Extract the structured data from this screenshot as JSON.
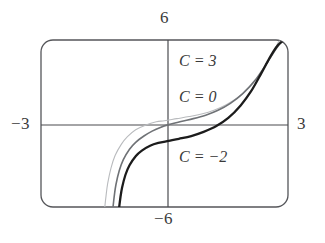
{
  "figure": {
    "kind": "graphing-calculator-plot",
    "background_color": "#ffffff",
    "frame": {
      "left": 41,
      "top": 40,
      "right": 288,
      "bottom": 207,
      "corner_radius": 12,
      "stroke_color": "#55565a",
      "stroke_width": 1.3
    },
    "axes": {
      "x_axis_y_px": 125,
      "y_axis_x_px": 168,
      "stroke_color": "#4a4b4f",
      "stroke_width": 1.2
    },
    "tick_labels": {
      "top": "6",
      "bottom": "−6",
      "left": "−3",
      "right": "3"
    }
  },
  "chart_data": {
    "type": "line",
    "title": "",
    "xlabel": "",
    "ylabel": "",
    "xlim": [
      -3,
      3
    ],
    "ylim": [
      -6,
      6
    ],
    "grid": false,
    "legend": "inline-curve-labels",
    "annotations": [
      {
        "text": "C = 3",
        "x_px": 179,
        "y_px": 52,
        "series": "C = 3"
      },
      {
        "text": "C = 0",
        "x_px": 179,
        "y_px": 88,
        "series": "C = 0"
      },
      {
        "text": "C = −2",
        "x_px": 179,
        "y_px": 148,
        "series": "C = −2"
      }
    ],
    "series": [
      {
        "name": "C = 3",
        "label": "C = 3",
        "C": 3,
        "color": "#b9bbbe",
        "stroke_width": 1.1,
        "x": [
          -1.45,
          -1.42,
          -1.38,
          -1.3,
          -1.2,
          -1.05,
          -0.9,
          -0.7,
          -0.45,
          -0.2,
          0.0,
          0.3,
          0.6,
          0.9,
          1.2,
          1.5,
          1.8,
          2.1,
          2.4,
          2.62,
          2.74,
          2.8
        ],
        "y": [
          -6.0,
          -5.2,
          -4.3,
          -3.2,
          -2.3,
          -1.5,
          -0.95,
          -0.45,
          -0.1,
          0.12,
          0.2,
          0.35,
          0.5,
          0.68,
          0.95,
          1.35,
          1.9,
          2.7,
          3.9,
          5.0,
          5.7,
          6.0
        ]
      },
      {
        "name": "C = 0",
        "label": "C = 0",
        "C": 0,
        "color": "#6f7276",
        "stroke_width": 1.6,
        "x": [
          -1.25,
          -1.22,
          -1.18,
          -1.1,
          -1.0,
          -0.85,
          -0.7,
          -0.5,
          -0.3,
          -0.1,
          0.1,
          0.4,
          0.7,
          1.0,
          1.3,
          1.6,
          1.9,
          2.2,
          2.5,
          2.72,
          2.84,
          2.9
        ],
        "y": [
          -6.0,
          -5.2,
          -4.4,
          -3.4,
          -2.6,
          -1.85,
          -1.35,
          -0.9,
          -0.55,
          -0.28,
          -0.08,
          0.15,
          0.35,
          0.6,
          0.95,
          1.45,
          2.15,
          3.1,
          4.4,
          5.4,
          5.85,
          6.0
        ]
      },
      {
        "name": "C = −2",
        "label": "C = −2",
        "C": -2,
        "color": "#1c1c1c",
        "stroke_width": 2.3,
        "x": [
          -1.1,
          -1.07,
          -1.03,
          -0.95,
          -0.85,
          -0.7,
          -0.55,
          -0.35,
          -0.15,
          0.1,
          0.35,
          0.65,
          0.95,
          1.25,
          1.55,
          1.85,
          2.1,
          2.35,
          2.55,
          2.72,
          2.84,
          2.92
        ],
        "y": [
          -6.0,
          -5.3,
          -4.6,
          -3.7,
          -3.0,
          -2.35,
          -1.95,
          -1.6,
          -1.4,
          -1.25,
          -1.1,
          -0.9,
          -0.6,
          -0.2,
          0.4,
          1.3,
          2.3,
          3.6,
          4.7,
          5.5,
          5.85,
          6.0
        ]
      }
    ]
  }
}
